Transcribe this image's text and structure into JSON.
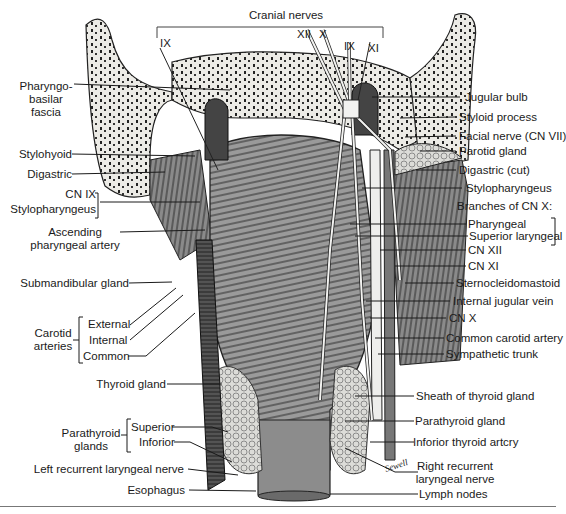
{
  "figure": {
    "signature": "Sewell",
    "colors": {
      "ink": "#1a1a1a",
      "bone": "#e9e7e2",
      "muscle": "#8e8e8e",
      "vessel_dark": "#3a3a3a",
      "nerve": "#f4f4f2",
      "gland": "#d6d6d2"
    }
  },
  "labels": {
    "cranial_nerves": {
      "heading": "Cranial nerves",
      "ix_left": "IX",
      "xii": "XII",
      "x": "X",
      "ix_right": "IX",
      "xi": "XI"
    },
    "left": {
      "pharyngobasilar": [
        "Pharyngo-",
        "basilar",
        "fascia"
      ],
      "stylohyoid": "Stylohyoid",
      "digastric": "Digastric",
      "cn_ix": "CN IX",
      "stylopharyngeus": "Stylopharyngeus",
      "ascending_pharyngeal": [
        "Ascending",
        "pharyngeal artery"
      ],
      "submandibular": "Submandibular gland",
      "carotid_group": [
        "Carotid",
        "arteries"
      ],
      "carotid_external": "External",
      "carotid_internal": "Internal",
      "carotid_common": "Common",
      "thyroid_gland": "Thyroid gland",
      "parathyroid_group": [
        "Parathyroid",
        "glands"
      ],
      "parathyroid_superior": "Superior",
      "parathyroid_inferior": "Inforior",
      "left_recurrent": "Left recurrent laryngeal nerve",
      "esophagus": "Esophagus"
    },
    "right": {
      "jugular_bulb": "Jugular bulb",
      "styloid_process": "Styloid process",
      "facial_nerve": "Facial nerve (CN VII)",
      "parotid_gland": "Parotid gland",
      "digastric_cut": "Digastric (cut)",
      "stylopharyngeus": "Stylopharyngeus",
      "branches_heading": "Branches of CN X:",
      "pharyngeal": "Pharyngeal",
      "superior_laryngeal": "Superior laryngeal",
      "cn_xii": "CN XII",
      "cn_xi": "CN XI",
      "sternocleidomastoid": "Sternocleidomastoid",
      "internal_jugular": "Internal jugular vein",
      "cn_x": "CN X",
      "common_carotid": "Common carotid artery",
      "sympathetic_trunk": "Sympathetic trunk",
      "sheath_thyroid": "Sheath of thyroid gland",
      "parathyroid_gland": "Parathyroid gland",
      "inferior_thyroid": "Inforior thyroid artcry",
      "right_recurrent": [
        "Right recurrent",
        "laryngeal nerve"
      ],
      "lymph_nodes": "Lymph nodes"
    }
  }
}
